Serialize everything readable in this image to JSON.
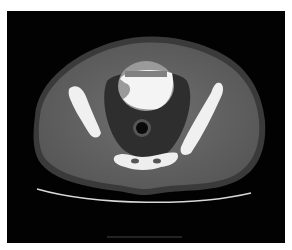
{
  "image": {
    "kind": "axial CT scan of pelvis",
    "background": "#ffffff",
    "frame_color": "#020202",
    "soft_tissue_color": "#6a6a6a",
    "fat_color": "#2a2a2a",
    "bone_color": "#f2f2f2",
    "bladder_contrast_color": "#f4f4f4"
  }
}
